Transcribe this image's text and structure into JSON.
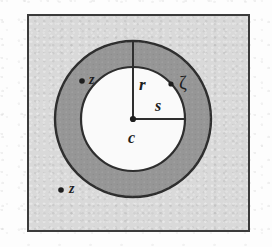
{
  "figure": {
    "caption": "",
    "background_color": "#d9d9d9",
    "annulus_color": "#969696",
    "disk_color": "#fafafa",
    "stroke_color": "#3b3b3b",
    "frame": {
      "x": 27,
      "y": 14,
      "width": 223,
      "height": 218
    },
    "circles": {
      "center": {
        "x": 104,
        "y": 103
      },
      "outer_radius": 78,
      "inner_radius": 52
    },
    "labels": {
      "radius_outer": "r",
      "radius_inner": "s",
      "center": "c",
      "boundary_point": "ζ",
      "point_in_annulus": "z",
      "point_outside": "z"
    },
    "points": [
      {
        "name": "center",
        "label": "c",
        "x": 104,
        "y": 103
      },
      {
        "name": "boundary-zeta",
        "label": "ζ",
        "x": 146,
        "y": 57
      },
      {
        "name": "annulus-point-z",
        "label": "z",
        "x": 54,
        "y": 66
      },
      {
        "name": "outside-point-z",
        "label": "z",
        "x": 33,
        "y": 175
      }
    ]
  }
}
